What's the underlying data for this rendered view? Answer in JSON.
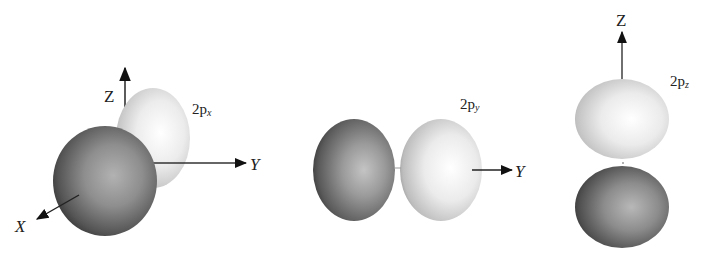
{
  "diagram": {
    "panels": [
      {
        "id": "2px",
        "label_main": "2p",
        "label_sub": "x",
        "axes": {
          "z": "Z",
          "y": "Y",
          "x": "X"
        },
        "lobes": [
          "front-dark",
          "back-light"
        ]
      },
      {
        "id": "2py",
        "label_main": "2p",
        "label_sub": "y",
        "axes": {
          "y": "Y"
        },
        "lobes": [
          "left-dark",
          "right-light"
        ]
      },
      {
        "id": "2pz",
        "label_main": "2p",
        "label_sub": "z",
        "axes": {
          "z": "Z"
        },
        "lobes": [
          "top-light",
          "bottom-dark"
        ]
      }
    ]
  },
  "colors": {
    "dark_lobe_edge": "#3a3a3a",
    "dark_lobe_center": "#a8a8a8",
    "light_lobe_edge": "#9a9a9a",
    "light_lobe_center": "#ffffff",
    "axis": "#111111",
    "background": "#ffffff"
  }
}
